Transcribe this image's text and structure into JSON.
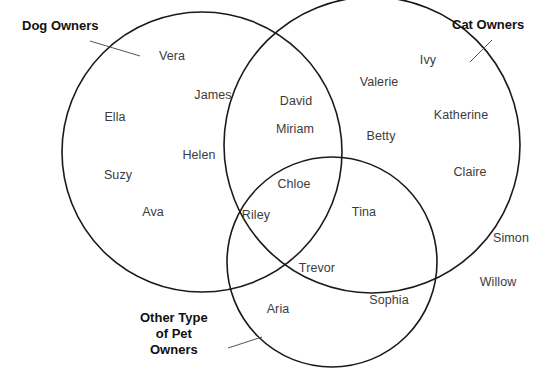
{
  "diagram": {
    "type": "venn-3-set",
    "title_visible": false,
    "background_color": "#ffffff",
    "outline_color": "#1a1a1a",
    "name_text_color": "#3b3b3b",
    "label_text_color": "#111111",
    "sets": [
      {
        "id": "dog",
        "label": "Dog Owners",
        "label_lines": [
          "Dog Owners"
        ],
        "label_x": 22,
        "label_y": 18,
        "leader": {
          "x1": 90,
          "y1": 41,
          "x2": 140,
          "y2": 56
        },
        "circle": {
          "cx": 202,
          "cy": 152,
          "r": 140
        }
      },
      {
        "id": "cat",
        "label": "Cat Owners",
        "label_lines": [
          "Cat Owners"
        ],
        "label_x": 452,
        "label_y": 17,
        "leader": {
          "x1": 492,
          "y1": 40,
          "x2": 470,
          "y2": 62
        },
        "circle": {
          "cx": 372,
          "cy": 145,
          "r": 148
        }
      },
      {
        "id": "other",
        "label": "Other Type of Pet Owners",
        "label_lines": [
          "Other Type",
          "of  Pet",
          "Owners"
        ],
        "label_x": 140,
        "label_y": 310,
        "leader": {
          "x1": 228,
          "y1": 348,
          "x2": 262,
          "y2": 337
        },
        "circle": {
          "cx": 332,
          "cy": 262,
          "r": 105
        }
      }
    ],
    "regions": [
      {
        "id": "dog-only",
        "members": [
          "Vera",
          "James",
          "Ella",
          "Helen",
          "Suzy",
          "Ava"
        ]
      },
      {
        "id": "cat-only",
        "members": [
          "Ivy",
          "Valerie",
          "Katherine",
          "Betty",
          "Claire"
        ]
      },
      {
        "id": "other-only",
        "members": [
          "Trevor",
          "Aria",
          "Sophia"
        ]
      },
      {
        "id": "dog-cat",
        "members": [
          "David",
          "Miriam"
        ]
      },
      {
        "id": "dog-other",
        "members": [
          "Riley"
        ]
      },
      {
        "id": "cat-other",
        "members": [
          "Tina"
        ]
      },
      {
        "id": "dog-cat-other",
        "members": [
          "Chloe"
        ]
      },
      {
        "id": "outside",
        "members": [
          "Simon",
          "Willow"
        ]
      }
    ],
    "names": [
      {
        "text": "Vera",
        "x": 172,
        "y": 56,
        "region": "dog-only"
      },
      {
        "text": "James",
        "x": 213,
        "y": 95,
        "region": "dog-only"
      },
      {
        "text": "Ella",
        "x": 115,
        "y": 117,
        "region": "dog-only"
      },
      {
        "text": "Helen",
        "x": 199,
        "y": 155,
        "region": "dog-only"
      },
      {
        "text": "Suzy",
        "x": 118,
        "y": 175,
        "region": "dog-only"
      },
      {
        "text": "Ava",
        "x": 153,
        "y": 212,
        "region": "dog-only"
      },
      {
        "text": "David",
        "x": 296,
        "y": 101,
        "region": "dog-cat"
      },
      {
        "text": "Miriam",
        "x": 295,
        "y": 129,
        "region": "dog-cat"
      },
      {
        "text": "Ivy",
        "x": 428,
        "y": 60,
        "region": "cat-only"
      },
      {
        "text": "Valerie",
        "x": 379,
        "y": 82,
        "region": "cat-only"
      },
      {
        "text": "Katherine",
        "x": 461,
        "y": 115,
        "region": "cat-only"
      },
      {
        "text": "Betty",
        "x": 381,
        "y": 136,
        "region": "cat-only"
      },
      {
        "text": "Claire",
        "x": 470,
        "y": 172,
        "region": "cat-only"
      },
      {
        "text": "Chloe",
        "x": 294,
        "y": 184,
        "region": "dog-cat-other"
      },
      {
        "text": "Riley",
        "x": 256,
        "y": 215,
        "region": "dog-other"
      },
      {
        "text": "Tina",
        "x": 364,
        "y": 212,
        "region": "cat-other"
      },
      {
        "text": "Trevor",
        "x": 317,
        "y": 268,
        "region": "other-only"
      },
      {
        "text": "Aria",
        "x": 278,
        "y": 309,
        "region": "other-only"
      },
      {
        "text": "Sophia",
        "x": 389,
        "y": 300,
        "region": "other-only"
      },
      {
        "text": "Simon",
        "x": 511,
        "y": 238,
        "region": "outside"
      },
      {
        "text": "Willow",
        "x": 498,
        "y": 282,
        "region": "outside"
      }
    ]
  }
}
